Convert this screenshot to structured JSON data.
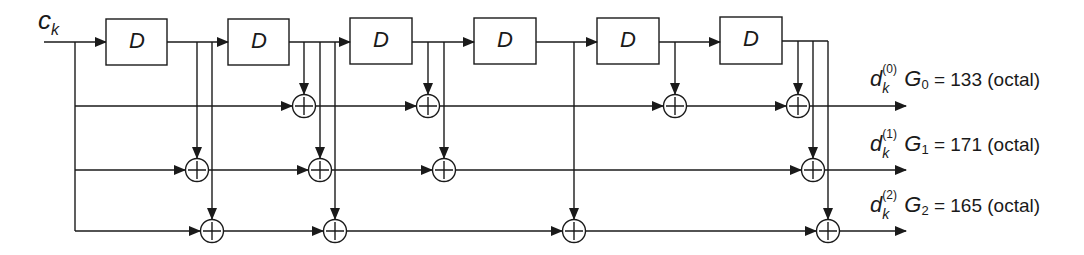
{
  "diagram": {
    "type": "convolutional-encoder",
    "input_label": {
      "symbol": "c",
      "subscript": "k"
    },
    "delay_label": "D",
    "delay_count": 6,
    "delays": [
      "D",
      "D",
      "D",
      "D",
      "D",
      "D"
    ],
    "outputs": [
      {
        "symbol": "d",
        "superscript": "(0)",
        "subscript": "k",
        "generator": "G",
        "generator_index": "0",
        "equation": "= 133 (octal)"
      },
      {
        "symbol": "d",
        "superscript": "(1)",
        "subscript": "k",
        "generator": "G",
        "generator_index": "1",
        "equation": "= 171 (octal)"
      },
      {
        "symbol": "d",
        "superscript": "(2)",
        "subscript": "k",
        "generator": "G",
        "generator_index": "2",
        "equation": "= 165 (octal)"
      }
    ],
    "adder_symbol": "⊕",
    "colors": {
      "line": "#1a1a1a",
      "background": "#ffffff"
    }
  }
}
